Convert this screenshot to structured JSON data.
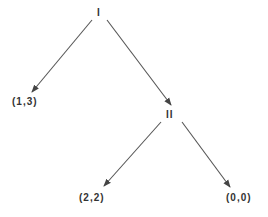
{
  "diagram": {
    "type": "game-tree",
    "nodes": {
      "root": {
        "label": "I"
      },
      "player2": {
        "label": "II"
      }
    },
    "payoffs": {
      "left_of_root": "(1,3)",
      "left_of_player2": "(2,2)",
      "right_of_player2": "(0,0)"
    },
    "edges": [
      {
        "from": "I",
        "to": "(1,3)"
      },
      {
        "from": "I",
        "to": "II"
      },
      {
        "from": "II",
        "to": "(2,2)"
      },
      {
        "from": "II",
        "to": "(0,0)"
      }
    ],
    "colors": {
      "line": "#444444",
      "background": "#ffffff"
    }
  }
}
